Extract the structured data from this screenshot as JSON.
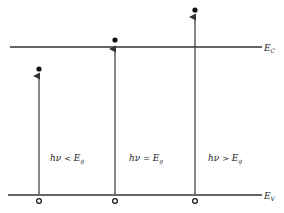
{
  "diagram": {
    "type": "energy-band-absorption",
    "levels": {
      "conduction": {
        "label": "E",
        "subscript": "C",
        "y": 47
      },
      "valence": {
        "label": "E",
        "subscript": "V",
        "y": 195
      }
    },
    "transitions": [
      {
        "x": 39,
        "electron_y": 69,
        "label_lhs": "hν",
        "relation": "<",
        "label_rhs": "E",
        "rhs_subscript": "g"
      },
      {
        "x": 115,
        "electron_y": 40,
        "label_lhs": "hν",
        "relation": "=",
        "label_rhs": "E",
        "rhs_subscript": "g"
      },
      {
        "x": 195,
        "electron_y": 10,
        "label_lhs": "hν",
        "relation": ">",
        "label_rhs": "E",
        "rhs_subscript": "g"
      }
    ],
    "colors": {
      "line": "#333333",
      "background": "#ffffff"
    }
  }
}
